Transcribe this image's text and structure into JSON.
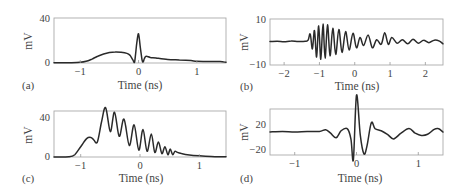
{
  "chart_data": [
    {
      "id": "a",
      "panel_label": "(a)",
      "type": "line",
      "title": "",
      "xlabel": "Time (ns)",
      "ylabel": "mV",
      "xlim": [
        -1.45,
        1.5
      ],
      "ylim": [
        0,
        40
      ],
      "xticks": [
        -1,
        0,
        1
      ],
      "xtick_labels": [
        "−1",
        "0",
        "1"
      ],
      "yticks": [
        0,
        40
      ],
      "ytick_labels": [
        "0",
        "40"
      ],
      "grid": false,
      "frame": {
        "x0": 54,
        "x1": 226,
        "y0": 18,
        "y1": 63
      },
      "series": [
        {
          "name": "signal",
          "x": [
            -1.45,
            -1.2,
            -1.0,
            -0.9,
            -0.8,
            -0.7,
            -0.6,
            -0.5,
            -0.4,
            -0.3,
            -0.2,
            -0.15,
            -0.1,
            -0.07,
            -0.05,
            -0.03,
            0.0,
            0.03,
            0.06,
            0.08,
            0.1,
            0.13,
            0.2,
            0.3,
            0.5,
            0.7,
            0.9,
            1.0,
            1.2,
            1.4,
            1.5
          ],
          "values": [
            0.3,
            0.3,
            0.6,
            1.5,
            3.5,
            6,
            8,
            9.3,
            9.8,
            9.5,
            8.5,
            7,
            3,
            0.5,
            8,
            18,
            26,
            14,
            3,
            1,
            4,
            6,
            5,
            4.5,
            3.2,
            2.7,
            2.2,
            1.5,
            1.4,
            1.2,
            0.6
          ]
        }
      ]
    },
    {
      "id": "b",
      "panel_label": "(b)",
      "type": "line",
      "title": "",
      "xlabel": "Time (ns)",
      "ylabel": "mV",
      "xlim": [
        -2.4,
        2.5
      ],
      "ylim": [
        -10,
        10
      ],
      "xticks": [
        -2,
        -1,
        0,
        1,
        2
      ],
      "xtick_labels": [
        "−2",
        "−1",
        "0",
        "1",
        "2"
      ],
      "yticks": [
        -10,
        10
      ],
      "ytick_labels": [
        "−10",
        "10"
      ],
      "grid": false,
      "frame": {
        "x0": 270,
        "x1": 443,
        "y0": 19,
        "y1": 65
      },
      "series": [
        {
          "name": "signal",
          "x": [
            -2.4,
            -2.2,
            -2.0,
            -1.8,
            -1.6,
            -1.4,
            -1.32,
            -1.26,
            -1.2,
            -1.14,
            -1.08,
            -1.02,
            -0.96,
            -0.9,
            -0.84,
            -0.77,
            -0.7,
            -0.62,
            -0.54,
            -0.45,
            -0.36,
            -0.26,
            -0.16,
            -0.05,
            0.05,
            0.15,
            0.25,
            0.38,
            0.5,
            0.62,
            0.75,
            0.85,
            0.95,
            1.05,
            1.2,
            1.35,
            1.5,
            1.65,
            1.8,
            1.95,
            2.1,
            2.25,
            2.4,
            2.5
          ],
          "values": [
            0.2,
            0.3,
            0.1,
            0.4,
            0.2,
            0.3,
            0.8,
            3.5,
            -3,
            5,
            -6.5,
            7,
            -7.5,
            7.8,
            -7,
            7.5,
            -6,
            6,
            -5.5,
            5.5,
            -4.5,
            4.5,
            -3.5,
            3.8,
            -2.5,
            2,
            -1.5,
            3,
            -2.5,
            1,
            -1,
            4,
            -1,
            2,
            -0.5,
            1,
            -0.8,
            1.2,
            -0.5,
            0.8,
            -0.3,
            0.8,
            0.4,
            -0.8
          ]
        }
      ]
    },
    {
      "id": "c",
      "panel_label": "(c)",
      "type": "line",
      "title": "",
      "xlabel": "Time (ns)",
      "ylabel": "mV",
      "xlim": [
        -1.45,
        1.45
      ],
      "ylim": [
        0,
        40
      ],
      "xticks": [
        -1,
        0,
        1
      ],
      "xtick_labels": [
        "−1",
        "0",
        "1"
      ],
      "yticks": [
        0,
        40
      ],
      "ytick_labels": [
        "0",
        "40"
      ],
      "grid": false,
      "frame": {
        "x0": 54,
        "x1": 226,
        "y0": 111,
        "y1": 157
      },
      "series": [
        {
          "name": "signal",
          "x": [
            -1.45,
            -1.2,
            -1.1,
            -1.0,
            -0.9,
            -0.83,
            -0.78,
            -0.72,
            -0.65,
            -0.58,
            -0.5,
            -0.43,
            -0.35,
            -0.27,
            -0.18,
            -0.1,
            -0.02,
            0.05,
            0.12,
            0.19,
            0.25,
            0.31,
            0.37,
            0.42,
            0.47,
            0.51,
            0.55,
            0.59,
            0.63,
            0.7,
            0.8,
            1.0,
            1.2,
            1.45
          ],
          "values": [
            0,
            0.2,
            2,
            9,
            16,
            17,
            15,
            13,
            30,
            43,
            22,
            39,
            18,
            33,
            10,
            28,
            6,
            24,
            5,
            20,
            4,
            13,
            3,
            9,
            2,
            7,
            2,
            5,
            4,
            3,
            2,
            1,
            0.5,
            0.2
          ]
        }
      ]
    },
    {
      "id": "d",
      "panel_label": "(d)",
      "type": "line",
      "title": "",
      "xlabel": "Time (ns)",
      "ylabel": "mV",
      "xlim": [
        -1.4,
        1.4
      ],
      "ylim": [
        -20,
        20
      ],
      "xticks": [
        -1,
        0,
        1
      ],
      "xtick_labels": [
        "−1",
        "0",
        "1"
      ],
      "yticks": [
        -20,
        20
      ],
      "ytick_labels": [
        "−20",
        "20"
      ],
      "grid": false,
      "frame": {
        "x0": 270,
        "x1": 443,
        "y0": 109,
        "y1": 155
      },
      "series": [
        {
          "name": "signal",
          "x": [
            -1.4,
            -1.2,
            -1.0,
            -0.8,
            -0.6,
            -0.5,
            -0.42,
            -0.33,
            -0.25,
            -0.15,
            -0.09,
            -0.05,
            0.0,
            0.06,
            0.12,
            0.17,
            0.24,
            0.3,
            0.4,
            0.5,
            0.6,
            0.72,
            0.85,
            0.95,
            1.05,
            1.15,
            1.25,
            1.32,
            1.4
          ],
          "values": [
            0,
            0.5,
            0,
            0.5,
            0.5,
            2,
            -1,
            -5,
            1,
            3,
            -6,
            -24,
            32,
            -2,
            -19,
            -12,
            8,
            3,
            1,
            -2,
            -6,
            -1,
            3,
            -1,
            -3,
            -2,
            2,
            3,
            0
          ]
        }
      ]
    }
  ]
}
